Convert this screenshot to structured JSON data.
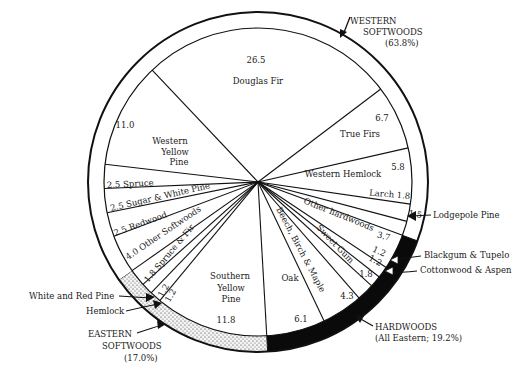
{
  "chart_data": {
    "type": "pie",
    "title": "",
    "center": [
      258,
      182
    ],
    "inner_radius": 154,
    "outer_radius": 170,
    "start_angle_deg": -43.4,
    "slices": [
      {
        "label": "Douglas Fir",
        "value": 26.5,
        "value_text": "26.5",
        "group": "western"
      },
      {
        "label": "True Firs",
        "value": 6.7,
        "value_text": "6.7",
        "group": "western"
      },
      {
        "label": "Western Hemlock",
        "value": 5.8,
        "value_text": "5.8",
        "group": "western"
      },
      {
        "label": "Larch",
        "value": 1.8,
        "value_text": "1.8",
        "group": "western"
      },
      {
        "label": "Lodgepole Pine",
        "value": 1.5,
        "value_text": "1.5",
        "group": "western"
      },
      {
        "label": "Other hardwoods",
        "value": 3.7,
        "value_text": "3.7",
        "group": "hardwoods"
      },
      {
        "label": "Blackgum & Tupelo",
        "value": 1.2,
        "value_text": "1.2",
        "group": "hardwoods"
      },
      {
        "label": "Cottonwood & Aspen",
        "value": 1.2,
        "value_text": "1.2",
        "group": "hardwoods"
      },
      {
        "label": "Sweet Gum",
        "value": 1.8,
        "value_text": "1.8",
        "group": "hardwoods"
      },
      {
        "label": "Beech, Birch & Maple",
        "value": 4.3,
        "value_text": "4.3",
        "group": "hardwoods"
      },
      {
        "label": "Oak",
        "value": 6.1,
        "value_text": "6.1",
        "group": "hardwoods"
      },
      {
        "label": "Southern Yellow Pine",
        "value": 11.8,
        "value_text": "11.8",
        "group": "eastern"
      },
      {
        "label": "Hemlock",
        "value": 1.2,
        "value_text": "1.2",
        "group": "eastern"
      },
      {
        "label": "White and Red Pine",
        "value": 1.2,
        "value_text": "1.2",
        "group": "eastern"
      },
      {
        "label": "Spruce & Fir",
        "value": 1.8,
        "value_text": "1.8",
        "group": "eastern"
      },
      {
        "label": "Other Softwoods",
        "value": 4.0,
        "value_text": "4.0",
        "group": "western"
      },
      {
        "label": "Redwood",
        "value": 2.5,
        "value_text": "2.5",
        "group": "western"
      },
      {
        "label": "Sugar & White Pine",
        "value": 2.5,
        "value_text": "2.5",
        "group": "western"
      },
      {
        "label": "Spruce",
        "value": 2.5,
        "value_text": "2.5",
        "group": "western"
      },
      {
        "label": "Western Yellow Pine",
        "value": 11.0,
        "value_text": "11.0",
        "group": "western"
      }
    ],
    "groups": [
      {
        "id": "western",
        "label": "WESTERN SOFTWOODS",
        "percent_text": "(63.8%)",
        "ring_fill": "white"
      },
      {
        "id": "hardwoods",
        "label": "HARDWOODS",
        "percent_text": "(All Eastern; 19.2%)",
        "ring_fill": "black"
      },
      {
        "id": "eastern",
        "label": "EASTERN SOFTWOODS",
        "percent_text": "(17.0%)",
        "ring_fill": "stipple"
      }
    ],
    "callouts": {
      "western_line1": "WESTERN",
      "western_line2": "SOFTWOODS",
      "western_line3": "(63.8%)",
      "hardwoods_line1": "HARDWOODS",
      "hardwoods_line2": "(All Eastern; 19.2%)",
      "eastern_line1": "EASTERN",
      "eastern_line2": "SOFTWOODS",
      "eastern_line3": "(17.0%)",
      "lodgepole": "Lodgepole Pine",
      "blackgum": "Blackgum & Tupelo",
      "cottonwood": "Cottonwood & Aspen",
      "white_red_pine": "White and Red Pine",
      "hemlock": "Hemlock"
    },
    "inside_labels": {
      "douglas_value": "26.5",
      "douglas_name": "Douglas Fir",
      "truefirs_value": "6.7",
      "truefirs_name": "True Firs",
      "whemlock_value": "5.8",
      "whemlock_name": "Western Hemlock",
      "larch": "Larch 1.8",
      "lodgepole_value": "1.5",
      "otherhard_name": "Other hardwoods",
      "otherhard_value": "3.7",
      "blackgum_value": "1.2",
      "cottonwood_value": "1.2",
      "sweetgum_name": "Sweet Gum",
      "sweetgum_value": "1.8",
      "beech_name": "Beech, Birch & Maple",
      "beech_value": "4.3",
      "oak_name": "Oak",
      "oak_value": "6.1",
      "syp_l1": "Southern",
      "syp_l2": "Yellow",
      "syp_l3": "Pine",
      "syp_value": "11.8",
      "hemlock_value": "1.2",
      "wrp_value": "1.2",
      "sprucefir": "1.8 Spruce & Fir",
      "othersoft": "4.0 Other Softwoods",
      "redwood": "2.5 Redwood",
      "sugar": "2.5 Sugar & White Pine",
      "spruce": "2.5 Spruce",
      "wyp_value": "11.0",
      "wyp_l1": "Western",
      "wyp_l2": "Yellow",
      "wyp_l3": "Pine"
    }
  }
}
